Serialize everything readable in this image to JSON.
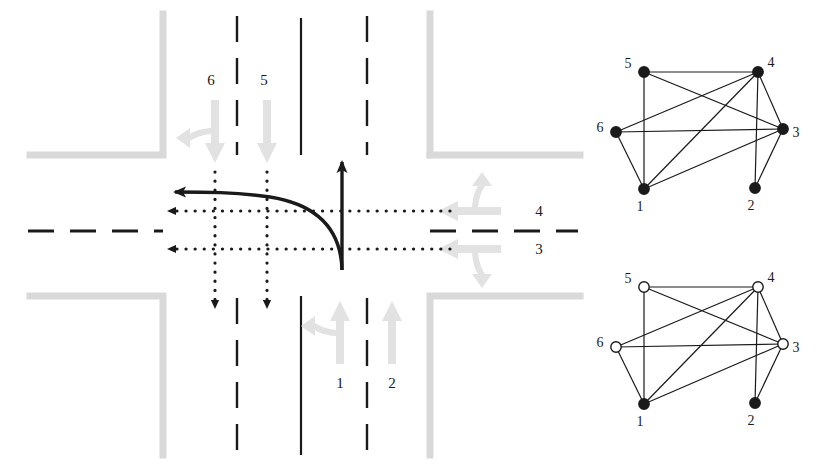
{
  "figure": {
    "background_color": "#ffffff"
  },
  "colors": {
    "road_marking_dark": "#1a1a1a",
    "curb_gray": "#d9d9d9",
    "lane_arrow_gray": "#e0e0e0",
    "node_fill_black": "#1a1a1a",
    "node_fill_white": "#ffffff",
    "edge_stroke": "#1a1a1a"
  },
  "intersection": {
    "name": "four-leg-intersection",
    "lane_labels": [
      {
        "id": "lane-label-6",
        "text": "6",
        "x": 216,
        "y": 80,
        "approach": "north",
        "movement": "left-and-through"
      },
      {
        "id": "lane-label-5",
        "text": "5",
        "x": 268,
        "y": 80,
        "approach": "north",
        "movement": "through"
      },
      {
        "id": "lane-label-4",
        "text": "4",
        "x": 539,
        "y": 211,
        "approach": "east",
        "movement": "left-and-through"
      },
      {
        "id": "lane-label-3",
        "text": "3",
        "x": 539,
        "y": 249,
        "approach": "east",
        "movement": "through-and-right"
      },
      {
        "id": "lane-label-1",
        "text": "1",
        "x": 340,
        "y": 383,
        "approach": "south",
        "movement": "left-and-through"
      },
      {
        "id": "lane-label-2",
        "text": "2",
        "x": 392,
        "y": 383,
        "approach": "south",
        "movement": "through"
      }
    ],
    "highlighted_movements": [
      {
        "name": "southbound-left-turn-path",
        "description": "solid curved arrow from south approach turning west"
      },
      {
        "name": "southbound-through-path",
        "description": "solid straight arrow from south approach heading north"
      }
    ],
    "conflicting_movements": [
      {
        "name": "movement-6-dotted",
        "description": "dotted arrow heading south"
      },
      {
        "name": "movement-5-dotted",
        "description": "dotted arrow heading south"
      },
      {
        "name": "movement-4-dotted",
        "description": "dotted arrow heading west"
      },
      {
        "name": "movement-3-dotted",
        "description": "dotted arrow heading west"
      }
    ]
  },
  "graphs": [
    {
      "name": "compatibility-graph-top",
      "nodes": [
        {
          "id": "1",
          "label": "1",
          "x": 54,
          "y": 134,
          "filled": true,
          "label_x": 50,
          "label_y": 156
        },
        {
          "id": "2",
          "label": "2",
          "x": 165,
          "y": 133,
          "filled": true,
          "label_x": 161,
          "label_y": 155
        },
        {
          "id": "3",
          "label": "3",
          "x": 193,
          "y": 74,
          "filled": true,
          "label_x": 206,
          "label_y": 82
        },
        {
          "id": "4",
          "label": "4",
          "x": 168,
          "y": 17,
          "filled": true,
          "label_x": 181,
          "label_y": 12
        },
        {
          "id": "5",
          "label": "5",
          "x": 54,
          "y": 17,
          "filled": true,
          "label_x": 38,
          "label_y": 13
        },
        {
          "id": "6",
          "label": "6",
          "x": 26,
          "y": 77,
          "filled": true,
          "label_x": 10,
          "label_y": 77
        }
      ],
      "edges": [
        [
          "5",
          "4"
        ],
        [
          "5",
          "1"
        ],
        [
          "5",
          "3"
        ],
        [
          "4",
          "6"
        ],
        [
          "4",
          "1"
        ],
        [
          "4",
          "2"
        ],
        [
          "4",
          "3"
        ],
        [
          "6",
          "3"
        ],
        [
          "6",
          "1"
        ],
        [
          "1",
          "3"
        ],
        [
          "3",
          "2"
        ]
      ]
    },
    {
      "name": "compatibility-graph-bottom",
      "nodes": [
        {
          "id": "1",
          "label": "1",
          "x": 54,
          "y": 134,
          "filled": true,
          "label_x": 50,
          "label_y": 156
        },
        {
          "id": "2",
          "label": "2",
          "x": 165,
          "y": 133,
          "filled": true,
          "label_x": 161,
          "label_y": 155
        },
        {
          "id": "3",
          "label": "3",
          "x": 193,
          "y": 74,
          "filled": false,
          "label_x": 206,
          "label_y": 82
        },
        {
          "id": "4",
          "label": "4",
          "x": 168,
          "y": 17,
          "filled": false,
          "label_x": 181,
          "label_y": 12
        },
        {
          "id": "5",
          "label": "5",
          "x": 54,
          "y": 17,
          "filled": false,
          "label_x": 38,
          "label_y": 13
        },
        {
          "id": "6",
          "label": "6",
          "x": 26,
          "y": 77,
          "filled": false,
          "label_x": 10,
          "label_y": 77
        }
      ],
      "edges": [
        [
          "5",
          "4"
        ],
        [
          "5",
          "1"
        ],
        [
          "5",
          "3"
        ],
        [
          "4",
          "6"
        ],
        [
          "4",
          "1"
        ],
        [
          "4",
          "2"
        ],
        [
          "4",
          "3"
        ],
        [
          "6",
          "3"
        ],
        [
          "6",
          "1"
        ],
        [
          "1",
          "3"
        ],
        [
          "3",
          "2"
        ]
      ]
    }
  ]
}
